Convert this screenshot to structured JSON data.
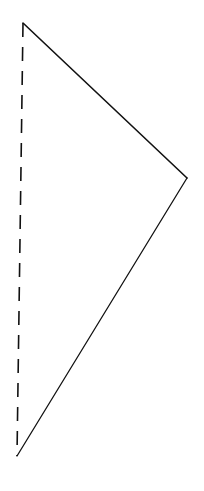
{
  "diagram": {
    "type": "triangle",
    "background": "#ffffff",
    "stroke_color": "#111111",
    "vertices": {
      "top": {
        "x": 23,
        "y": 23
      },
      "right": {
        "x": 187,
        "y": 178
      },
      "bottom": {
        "x": 17,
        "y": 456
      }
    },
    "edges": [
      {
        "name": "top-to-right",
        "from": "top",
        "to": "right",
        "style": "solid"
      },
      {
        "name": "right-to-bottom",
        "from": "right",
        "to": "bottom",
        "style": "solid"
      },
      {
        "name": "bottom-to-top",
        "from": "bottom",
        "to": "top",
        "style": "dashed"
      }
    ]
  }
}
